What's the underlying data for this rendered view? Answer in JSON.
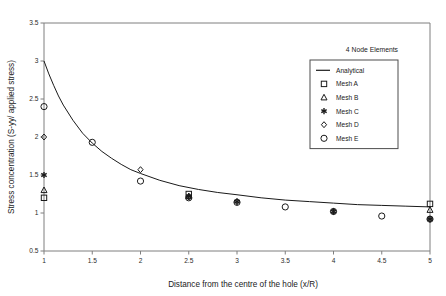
{
  "chart_data": {
    "type": "scatter",
    "title": "",
    "annotation": "4 Node Elements",
    "xlabel": "Distance from the centre of the hole (x/R)",
    "ylabel": "Stress concentration (S-yy/ applied stress)",
    "xlim": [
      1,
      5
    ],
    "ylim": [
      0.5,
      3.5
    ],
    "xticks": [
      "1",
      "1.5",
      "2",
      "2.5",
      "3",
      "3.5",
      "4",
      "4.5",
      "5"
    ],
    "xtick_values": [
      1,
      1.5,
      2,
      2.5,
      3,
      3.5,
      4,
      4.5,
      5
    ],
    "yticks": [
      "0.5",
      "1",
      "1.5",
      "2",
      "2.5",
      "3",
      "3.5"
    ],
    "ytick_values": [
      0.5,
      1,
      1.5,
      2,
      2.5,
      3,
      3.5
    ],
    "grid": false,
    "legend_position": "upper right",
    "legend_entries": [
      {
        "label": "Analytical",
        "marker": "line"
      },
      {
        "label": "Mesh A",
        "marker": "square"
      },
      {
        "label": "Mesh B",
        "marker": "triangle"
      },
      {
        "label": "Mesh C",
        "marker": "asterisk"
      },
      {
        "label": "Mesh D",
        "marker": "diamond"
      },
      {
        "label": "Mesh E",
        "marker": "circle"
      }
    ],
    "series": [
      {
        "name": "Analytical",
        "marker": "line",
        "x": [
          1.0,
          1.05,
          1.1,
          1.15,
          1.2,
          1.3,
          1.4,
          1.5,
          1.6,
          1.7,
          1.8,
          1.9,
          2.0,
          2.2,
          2.4,
          2.6,
          2.8,
          3.0,
          3.25,
          3.5,
          3.75,
          4.0,
          4.25,
          4.5,
          4.75,
          5.0
        ],
        "y": [
          3.0,
          2.83,
          2.68,
          2.54,
          2.42,
          2.22,
          2.05,
          1.92,
          1.81,
          1.72,
          1.64,
          1.57,
          1.52,
          1.43,
          1.36,
          1.31,
          1.27,
          1.24,
          1.2,
          1.17,
          1.15,
          1.13,
          1.11,
          1.1,
          1.09,
          1.08
        ]
      },
      {
        "name": "Mesh A",
        "marker": "square",
        "x": [
          1.0,
          2.5,
          5.0
        ],
        "y": [
          1.2,
          1.25,
          1.12
        ]
      },
      {
        "name": "Mesh B",
        "marker": "triangle",
        "x": [
          1.0,
          2.5,
          5.0
        ],
        "y": [
          1.3,
          1.22,
          1.04
        ]
      },
      {
        "name": "Mesh C",
        "marker": "asterisk",
        "x": [
          1.0,
          2.5,
          3.0,
          4.0,
          5.0
        ],
        "y": [
          1.5,
          1.22,
          1.15,
          1.02,
          0.92
        ]
      },
      {
        "name": "Mesh D",
        "marker": "diamond",
        "x": [
          1.0,
          2.0,
          2.5,
          3.0,
          4.0,
          5.0
        ],
        "y": [
          2.0,
          1.57,
          1.21,
          1.15,
          1.02,
          0.92
        ]
      },
      {
        "name": "Mesh E",
        "marker": "circle",
        "x": [
          1.0,
          1.5,
          2.0,
          2.5,
          3.0,
          3.5,
          4.0,
          4.5,
          5.0
        ],
        "y": [
          2.4,
          1.93,
          1.42,
          1.2,
          1.14,
          1.08,
          1.02,
          0.96,
          0.92
        ]
      }
    ]
  },
  "colors": {
    "axis": "#7f7f7f",
    "line": "#1a1a1a",
    "marker": "#1a1a1a",
    "text": "#1a1a1a",
    "background": "#ffffff"
  }
}
